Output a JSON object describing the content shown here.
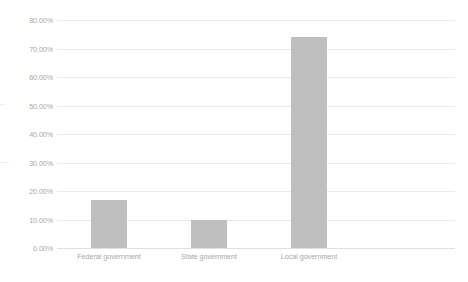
{
  "chart_data": {
    "type": "bar",
    "title": "",
    "subtitle": "",
    "xlabel": "",
    "ylabel": "",
    "categories": [
      "Federal government",
      "State government",
      "Local government"
    ],
    "values": [
      17.0,
      10.0,
      74.0
    ],
    "value_labels": [
      "17.00%",
      "10.00%",
      "74.00%"
    ],
    "ylim": [
      0,
      80
    ],
    "ytick_values": [
      0,
      10,
      20,
      30,
      40,
      50,
      60,
      70,
      80
    ],
    "ytick_labels": [
      "0.00%",
      "10.00%",
      "20.00%",
      "30.00%",
      "40.00%",
      "50.00%",
      "60.00%",
      "70.00%",
      "80.00%"
    ],
    "grid": true,
    "grid_axis": "y",
    "legend": false,
    "legend_position": "none",
    "series": [
      {
        "name": "",
        "values": [
          17.0,
          10.0,
          74.0
        ],
        "color": "#bfbfbf"
      }
    ],
    "colors": {
      "bar_fill": "#bfbfbf",
      "gridline": "#eaeaea",
      "baseline": "#e0e0e0",
      "tick_text": "#a8a8a8",
      "background": "#ffffff"
    }
  }
}
